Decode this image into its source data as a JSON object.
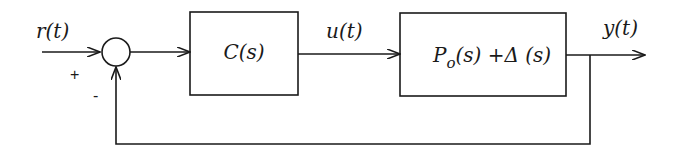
{
  "diagram": {
    "type": "feedback-control-block-diagram",
    "signals": {
      "reference": "r(t)",
      "control": "u(t)",
      "output": "y(t)"
    },
    "summing_junction": {
      "plus_sign": "+",
      "minus_sign": "-"
    },
    "blocks": [
      {
        "id": "controller",
        "label": "C(s)"
      },
      {
        "id": "plant",
        "label_main": "P",
        "label_sub": "o",
        "label_rest": "(s) +Δ (s)"
      }
    ],
    "feedback": "negative unity feedback from y(t) to summing junction"
  }
}
